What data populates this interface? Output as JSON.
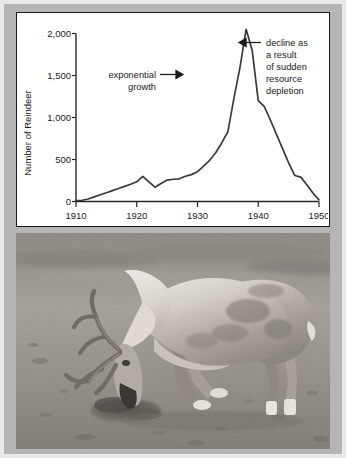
{
  "figure": {
    "border_color": "#b5b5b5",
    "paper_color": "#e9e9e9",
    "panel_background": "#ffffff"
  },
  "chart_data": {
    "type": "line",
    "title": "",
    "xlabel": "",
    "ylabel": "Number of Reindeer",
    "xlim": [
      1910,
      1950
    ],
    "ylim": [
      0,
      2000
    ],
    "xticks": [
      "1910",
      "1920",
      "1930",
      "1940",
      "1950"
    ],
    "xtick_values": [
      1910,
      1920,
      1930,
      1940,
      1950
    ],
    "yticks": [
      "0",
      "500",
      "1,000",
      "1,500",
      "2,000"
    ],
    "ytick_values": [
      0,
      500,
      1000,
      1500,
      2000
    ],
    "grid": false,
    "legend": false,
    "line_color": "#3a3a3a",
    "x": [
      1910,
      1911,
      1912,
      1913,
      1914,
      1915,
      1916,
      1917,
      1918,
      1919,
      1920,
      1921,
      1922,
      1923,
      1924,
      1925,
      1926,
      1927,
      1928,
      1929,
      1930,
      1931,
      1932,
      1933,
      1934,
      1935,
      1936,
      1937,
      1938,
      1939,
      1940,
      1941,
      1942,
      1943,
      1944,
      1945,
      1946,
      1947,
      1948,
      1949,
      1950
    ],
    "values": [
      10,
      15,
      30,
      55,
      80,
      105,
      130,
      155,
      180,
      205,
      235,
      300,
      235,
      170,
      215,
      255,
      265,
      270,
      300,
      320,
      355,
      420,
      490,
      580,
      700,
      830,
      1230,
      1600,
      2050,
      1800,
      1200,
      1130,
      970,
      800,
      630,
      460,
      310,
      290,
      200,
      100,
      20
    ],
    "annotations": [
      {
        "name": "exponential-growth",
        "lines": [
          "exponential",
          "growth"
        ],
        "arrow": "right",
        "points_to_year": 1936,
        "points_to_value": 1250
      },
      {
        "name": "decline-annotation",
        "lines": [
          "decline as",
          "a result",
          "of sudden",
          "resource",
          "depletion"
        ],
        "arrow": "left",
        "points_to_year": 1938,
        "points_to_value": 1900
      }
    ]
  },
  "photo": {
    "alt": "reindeer grazing on barren tundra ground",
    "subject": "reindeer",
    "tone": "grayscale"
  }
}
